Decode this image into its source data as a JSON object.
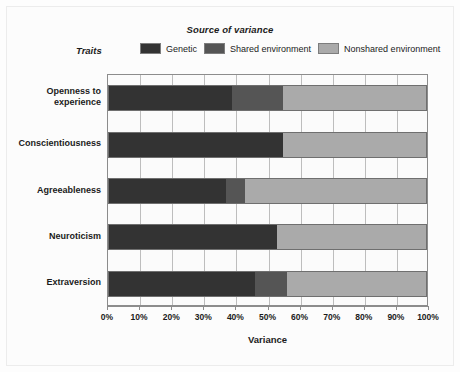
{
  "figure": {
    "legend_title": "Source of variance",
    "traits_label": "Traits",
    "x_axis_title": "Variance"
  },
  "chart_data": {
    "type": "bar",
    "orientation": "horizontal",
    "stacked": true,
    "title": "Source of variance",
    "xlabel": "Variance",
    "ylabel": "Traits",
    "xlim": [
      0,
      100
    ],
    "xunit": "%",
    "grid": true,
    "legend_position": "top",
    "categories": [
      "Openness to experience",
      "Conscientiousness",
      "Agreeableness",
      "Neuroticism",
      "Extraversion"
    ],
    "tick_labels": [
      "0%",
      "10%",
      "20%",
      "30%",
      "40%",
      "50%",
      "60%",
      "70%",
      "80%",
      "90%",
      "100%"
    ],
    "tick_values": [
      0,
      10,
      20,
      30,
      40,
      50,
      60,
      70,
      80,
      90,
      100
    ],
    "series": [
      {
        "name": "Genetic",
        "color": "#333333",
        "values": [
          39,
          55,
          37,
          53,
          46
        ]
      },
      {
        "name": "Shared environment",
        "color": "#555555",
        "values": [
          16,
          0,
          6,
          0,
          10
        ]
      },
      {
        "name": "Nonshared environment",
        "color": "#aaaaaa",
        "values": [
          45,
          45,
          57,
          47,
          44
        ]
      }
    ]
  }
}
